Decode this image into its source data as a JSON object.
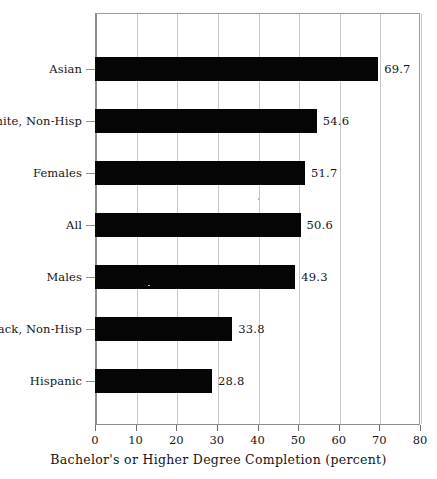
{
  "chart_data": {
    "type": "bar",
    "orientation": "horizontal",
    "title": "",
    "subtitle": "",
    "xlabel": "Bachelor's or Higher Degree Completion (percent)",
    "ylabel": "",
    "categories": [
      "Asian",
      "White, Non-Hisp",
      "Females",
      "All",
      "Males",
      "Black, Non-Hisp",
      "Hispanic"
    ],
    "values": [
      69.7,
      54.6,
      51.7,
      50.6,
      49.3,
      33.8,
      28.8
    ],
    "value_labels": [
      "69.7",
      "54.6",
      "51.7",
      "50.6",
      "49.3",
      "33.8",
      "28.8"
    ],
    "xlim": [
      0,
      80
    ],
    "xticks": [
      0,
      10,
      20,
      30,
      40,
      50,
      60,
      70,
      80
    ],
    "xtick_labels": [
      "0",
      "10",
      "20",
      "30",
      "40",
      "50",
      "60",
      "70",
      "80"
    ],
    "grid": true,
    "grid_axis": "x",
    "legend": false,
    "bar_color": "#050505",
    "grid_color": "#c9c9c9",
    "axis_color": "#8d8d8d",
    "background_color": "#ffffff",
    "text_color": "#151515"
  }
}
